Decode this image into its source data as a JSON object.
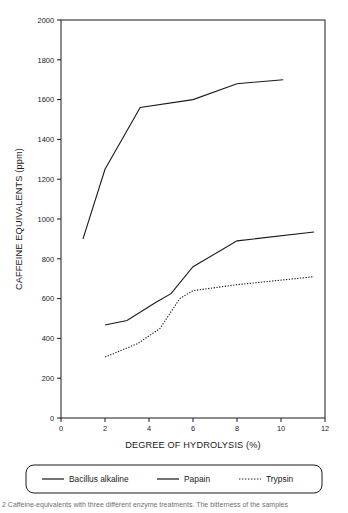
{
  "chart_data": {
    "type": "line",
    "title": "",
    "xlabel": "DEGREE OF HYDROLYSIS (%)",
    "ylabel": "CAFFEINE EQUIVALENTS (ppm)",
    "xlim": [
      0,
      12
    ],
    "ylim": [
      0,
      2000
    ],
    "xticks": [
      0,
      2,
      4,
      6,
      8,
      10,
      12
    ],
    "yticks": [
      0,
      200,
      400,
      600,
      800,
      1000,
      1200,
      1400,
      1600,
      1800,
      2000
    ],
    "grid": false,
    "legend_position": "below-plot",
    "series": [
      {
        "name": "Bacillus alkaline",
        "style": "solid",
        "color": "#1a1a1a",
        "points": [
          {
            "x": 1.0,
            "y": 900
          },
          {
            "x": 2.0,
            "y": 1250
          },
          {
            "x": 3.6,
            "y": 1560
          },
          {
            "x": 6.0,
            "y": 1600
          },
          {
            "x": 8.0,
            "y": 1680
          },
          {
            "x": 10.1,
            "y": 1700
          }
        ]
      },
      {
        "name": "Papain",
        "style": "solid",
        "color": "#1a1a1a",
        "points": [
          {
            "x": 2.0,
            "y": 467
          },
          {
            "x": 3.0,
            "y": 490
          },
          {
            "x": 4.3,
            "y": 580
          },
          {
            "x": 5.0,
            "y": 625
          },
          {
            "x": 6.0,
            "y": 760
          },
          {
            "x": 8.0,
            "y": 890
          },
          {
            "x": 11.5,
            "y": 935
          }
        ]
      },
      {
        "name": "Trypsin",
        "style": "dotted",
        "color": "#1a1a1a",
        "points": [
          {
            "x": 2.0,
            "y": 306
          },
          {
            "x": 3.5,
            "y": 375
          },
          {
            "x": 4.5,
            "y": 450
          },
          {
            "x": 5.4,
            "y": 600
          },
          {
            "x": 6.0,
            "y": 640
          },
          {
            "x": 8.0,
            "y": 670
          },
          {
            "x": 11.5,
            "y": 710
          }
        ]
      }
    ]
  },
  "legend": {
    "items": [
      {
        "label": "Bacillus alkaline",
        "style": "solid"
      },
      {
        "label": "Papain",
        "style": "solid"
      },
      {
        "label": "Trypsin",
        "style": "dotted"
      }
    ]
  },
  "caption": {
    "text": "2 Caffeine-equivalents with three different enzyme treatments. The bitterness of the samples"
  }
}
